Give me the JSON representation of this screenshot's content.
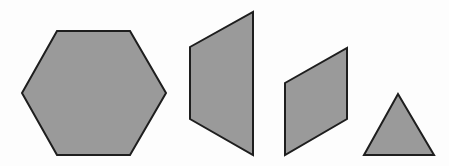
{
  "figure": {
    "background": "#fdfdfd",
    "fill_color": "#9a9a9a",
    "stroke_color": "#1e1e1e",
    "shapes": [
      {
        "name": "hexagon",
        "points": "57,31 130,31 166,93 130,155 57,155 22,93"
      },
      {
        "name": "trapezoid",
        "points": "190,47 253,12 253,155 190,119"
      },
      {
        "name": "parallelogram",
        "points": "285,83 347,48 347,119 285,155"
      },
      {
        "name": "triangle",
        "points": "398,94 434,155 364,155"
      }
    ]
  }
}
